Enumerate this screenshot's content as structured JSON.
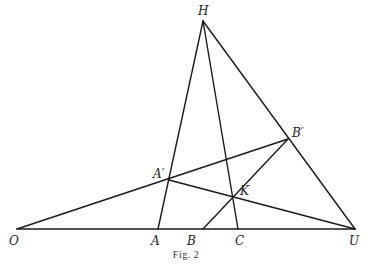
{
  "figure": {
    "caption": "Fig. 2",
    "points": {
      "H": {
        "label": "H",
        "x": 203,
        "y": 21,
        "lx": 198,
        "ly": 15
      },
      "O": {
        "label": "O",
        "x": 17,
        "y": 229,
        "lx": 9,
        "ly": 245
      },
      "A": {
        "label": "A",
        "x": 158,
        "y": 229,
        "lx": 151,
        "ly": 245
      },
      "B": {
        "label": "B",
        "x": 203,
        "y": 229,
        "lx": 187,
        "ly": 245
      },
      "C": {
        "label": "C",
        "x": 238,
        "y": 229,
        "lx": 235,
        "ly": 245
      },
      "U": {
        "label": "U",
        "x": 355,
        "y": 229,
        "lx": 349,
        "ly": 245
      },
      "A_prime": {
        "label": "A′",
        "x": 169,
        "y": 180,
        "lx": 153,
        "ly": 178
      },
      "B_prime": {
        "label": "B′",
        "x": 288,
        "y": 139,
        "lx": 292,
        "ly": 137
      },
      "K": {
        "label": "K",
        "x": 234,
        "y": 197,
        "lx": 240,
        "ly": 195
      }
    },
    "segments": [
      [
        "O",
        "U"
      ],
      [
        "O",
        "B_prime"
      ],
      [
        "A_prime",
        "U"
      ],
      [
        "H",
        "A"
      ],
      [
        "H",
        "C"
      ],
      [
        "H",
        "U"
      ],
      [
        "B",
        "B_prime"
      ]
    ]
  }
}
